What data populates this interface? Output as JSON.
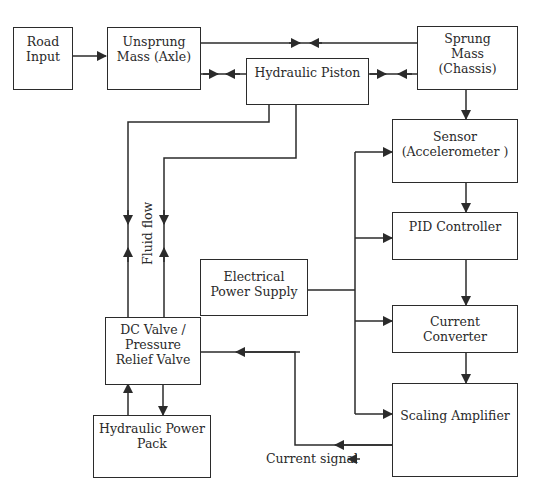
{
  "diagram": {
    "blocks": [
      {
        "id": "road_input",
        "lines": [
          "Road",
          "Input"
        ]
      },
      {
        "id": "unsprung_mass",
        "lines": [
          "Unsprung",
          "Mass (Axle)"
        ]
      },
      {
        "id": "hydraulic_piston",
        "lines": [
          "Hydraulic Piston"
        ]
      },
      {
        "id": "sprung_mass",
        "lines": [
          "Sprung",
          "Mass",
          "(Chassis)"
        ]
      },
      {
        "id": "sensor",
        "lines": [
          "Sensor",
          "(Accelerometer )"
        ]
      },
      {
        "id": "pid_controller",
        "lines": [
          "PID Controller"
        ]
      },
      {
        "id": "electrical_power_supply",
        "lines": [
          "Electrical",
          "Power Supply"
        ]
      },
      {
        "id": "current_converter",
        "lines": [
          "Current",
          "Converter"
        ]
      },
      {
        "id": "scaling_amplifier",
        "lines": [
          "Scaling Amplifier"
        ]
      },
      {
        "id": "dc_valve",
        "lines": [
          "DC Valve /",
          "Pressure",
          "Relief Valve"
        ]
      },
      {
        "id": "hydraulic_power_pack",
        "lines": [
          "Hydraulic Power",
          "Pack"
        ]
      }
    ],
    "labels": {
      "fluid_flow": "Fluid flow",
      "current_signal": "Current signal"
    },
    "connections": [
      {
        "from": "road_input",
        "to": "unsprung_mass",
        "type": "arrow"
      },
      {
        "from": "unsprung_mass",
        "to": "sprung_mass",
        "type": "bidirectional"
      },
      {
        "from": "unsprung_mass",
        "to": "hydraulic_piston",
        "type": "bidirectional"
      },
      {
        "from": "hydraulic_piston",
        "to": "sprung_mass",
        "type": "bidirectional"
      },
      {
        "from": "sprung_mass",
        "to": "sensor",
        "type": "arrow"
      },
      {
        "from": "sensor",
        "to": "pid_controller",
        "type": "arrow"
      },
      {
        "from": "pid_controller",
        "to": "current_converter",
        "type": "arrow"
      },
      {
        "from": "current_converter",
        "to": "scaling_amplifier",
        "type": "arrow"
      },
      {
        "from": "electrical_power_supply",
        "to": [
          "sensor",
          "pid_controller",
          "current_converter",
          "scaling_amplifier"
        ],
        "type": "bus"
      },
      {
        "from": "scaling_amplifier",
        "to": "dc_valve",
        "type": "arrow",
        "label": "Current signal"
      },
      {
        "from": "hydraulic_piston",
        "to": "dc_valve",
        "type": "fluid",
        "label": "Fluid flow"
      },
      {
        "from": "dc_valve",
        "to": "hydraulic_power_pack",
        "type": "arrow"
      },
      {
        "from": "hydraulic_power_pack",
        "to": "dc_valve",
        "type": "arrow"
      }
    ],
    "colors": {
      "line": "#2b2b2b",
      "background": "#ffffff"
    }
  }
}
